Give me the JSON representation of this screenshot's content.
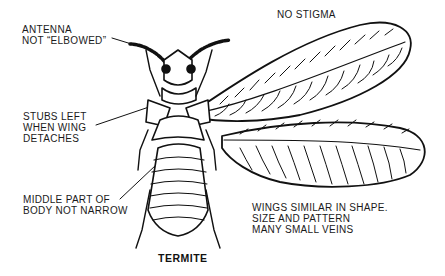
{
  "diagram": {
    "title": "TERMITE",
    "labels": {
      "antenna": [
        "ANTENNA",
        "NOT “ELBOWED”"
      ],
      "stigma": [
        "NO STIGMA"
      ],
      "stubs": [
        "STUBS LEFT",
        "WHEN WING",
        "DETACHES"
      ],
      "body": [
        "MIDDLE PART OF",
        "BODY NOT NARROW"
      ],
      "wings": [
        "WINGS SIMILAR IN SHAPE.",
        "SIZE AND PATTERN",
        "MANY SMALL VEINS"
      ]
    },
    "colors": {
      "ink": "#111111",
      "background": "#ffffff"
    }
  }
}
